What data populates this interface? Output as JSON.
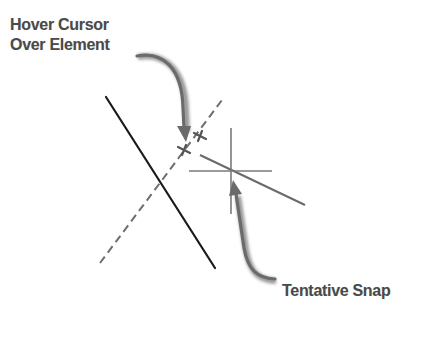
{
  "diagram": {
    "labels": {
      "hover_line1": "Hover Cursor",
      "hover_line2": "Over Element",
      "tentative_snap": "Tentative Snap"
    },
    "colors": {
      "text": "#4a4a4a",
      "solid_line": "#1a1a1a",
      "dashed_line": "#6e6e6e",
      "crosshair": "#6a6a6a",
      "arrow": "#6b6b6b",
      "background": "#ffffff"
    },
    "elements": [
      {
        "type": "solid-line",
        "from": [
          106,
          97
        ],
        "to": [
          215,
          268
        ]
      },
      {
        "type": "dashed-line",
        "from": [
          100,
          263
        ],
        "to": [
          222,
          100
        ]
      },
      {
        "type": "hover-cursor-marker",
        "at": [
          184,
          150
        ]
      },
      {
        "type": "hover-cursor-marker",
        "at": [
          200,
          136
        ]
      },
      {
        "type": "tentative-snap-crosshair",
        "center": [
          231,
          171
        ]
      },
      {
        "type": "gray-line",
        "from": [
          200,
          155
        ],
        "to": [
          305,
          205
        ]
      }
    ]
  }
}
